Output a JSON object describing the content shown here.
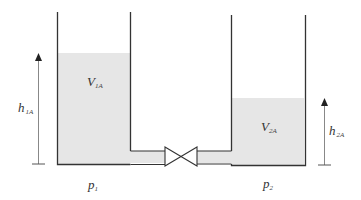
{
  "diagram": {
    "type": "two connected tanks with valve",
    "colors": {
      "liquid": "#e6e6e6",
      "wall": "#333333",
      "arrow": "#777777",
      "background": "#ffffff"
    },
    "tank1": {
      "volume_label": {
        "main": "V",
        "sub": "1A"
      },
      "height_label": {
        "main": "h",
        "sub": "1A"
      },
      "pressure_label": {
        "main": "p",
        "sub": "1"
      }
    },
    "tank2": {
      "volume_label": {
        "main": "V",
        "sub": "2A"
      },
      "height_label": {
        "main": "h",
        "sub": "2A"
      },
      "pressure_label": {
        "main": "p",
        "sub": "2"
      }
    },
    "valve": {
      "label": ""
    }
  }
}
